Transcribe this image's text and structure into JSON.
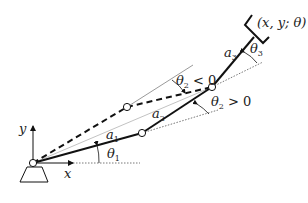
{
  "figure": {
    "type": "planar-3-link-manipulator",
    "labels": {
      "x_axis": "x",
      "y_axis": "y",
      "link1": "a",
      "link1_sub": "1",
      "link2": "a",
      "link2_sub": "2",
      "link3": "a",
      "link3_sub": "3",
      "theta1": "θ",
      "theta1_sub": "1",
      "theta2_neg": "θ",
      "theta2_neg_sub": "2",
      "theta2_neg_rel": " < 0",
      "theta2_pos": "θ",
      "theta2_pos_sub": "2",
      "theta2_pos_rel": " > 0",
      "theta3": "θ",
      "theta3_sub": "3",
      "end_effector_pose": "(x, y; θ)"
    },
    "joints": {
      "base": [
        33,
        163
      ],
      "elbow_down": [
        142,
        133
      ],
      "elbow_up": [
        127,
        107
      ],
      "wrist": [
        212,
        87
      ]
    },
    "colors": {
      "stroke": "#111111",
      "thin": "#888888",
      "background": "#ffffff"
    }
  }
}
